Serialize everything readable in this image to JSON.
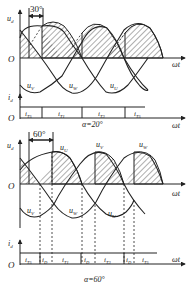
{
  "figure": {
    "colors": {
      "stroke": "#222222",
      "hatch": "#333333",
      "background": "#ffffff"
    }
  },
  "top_panel": {
    "y_axis_label": "u",
    "y_axis_sub": "d",
    "origin_label": "O",
    "x_axis_label": "ωt",
    "angle_marker": "30°",
    "phase_labels": [
      {
        "name": "u",
        "sub": "V"
      },
      {
        "name": "u",
        "sub": "W"
      },
      {
        "name": "u",
        "sub": "U"
      }
    ],
    "current_axis_label": "i",
    "current_axis_sub": "d",
    "current_origin_label": "O",
    "current_x_axis_label": "ωt",
    "current_segments": [
      {
        "name": "i",
        "sub": "T5"
      },
      {
        "name": "i",
        "sub": "T1"
      },
      {
        "name": "i",
        "sub": "T3"
      },
      {
        "name": "i",
        "sub": "T5"
      }
    ],
    "alpha_label": "α=20°"
  },
  "bottom_panel": {
    "y_axis_label": "u",
    "y_axis_sub": "d",
    "origin_label": "O",
    "x_axis_label": "ωt",
    "angle_marker": "60°",
    "peak_labels": [
      {
        "name": "u",
        "sub": "U"
      },
      {
        "name": "u",
        "sub": "V"
      },
      {
        "name": "u",
        "sub": "W"
      }
    ],
    "phase_labels": [
      {
        "name": "u",
        "sub": "V"
      },
      {
        "name": "u",
        "sub": "W"
      },
      {
        "name": "u",
        "sub": "U"
      }
    ],
    "current_axis_label": "i",
    "current_axis_sub": "d",
    "current_origin_label": "O",
    "current_x_axis_label": "ωt",
    "current_segments": [
      {
        "name": "i",
        "sub": "T5"
      },
      {
        "name": "i",
        "sub": "D"
      },
      {
        "name": "i",
        "sub": "T1"
      },
      {
        "name": "i",
        "sub": "D"
      },
      {
        "name": "i",
        "sub": "T3"
      },
      {
        "name": "i",
        "sub": "D"
      },
      {
        "name": "i",
        "sub": "T5"
      }
    ],
    "alpha_label": "α=60°"
  }
}
